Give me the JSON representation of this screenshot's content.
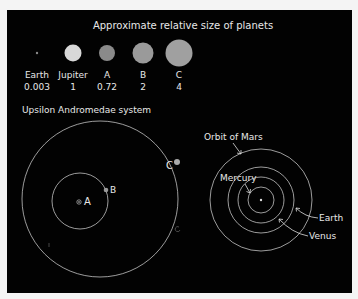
{
  "size_chart": {
    "title": "Approximate relative size of planets",
    "planets": [
      {
        "name": "Earth",
        "value": "0.003",
        "color": "#888888"
      },
      {
        "name": "Jupiter",
        "value": "1",
        "color": "#d8d8d8"
      },
      {
        "name": "A",
        "value": "0.72",
        "color": "#8a8a8a"
      },
      {
        "name": "B",
        "value": "2",
        "color": "#9a9a9a"
      },
      {
        "name": "C",
        "value": "4",
        "color": "#a0a0a0"
      }
    ]
  },
  "upsilon": {
    "title": "Upsilon Andromedae system",
    "labels": {
      "a": "A",
      "b": "B",
      "c": "C"
    }
  },
  "solar": {
    "labels": {
      "mars": "Orbit of Mars",
      "mercury": "Mercury",
      "earth": "Earth",
      "venus": "Venus"
    }
  },
  "colors": {
    "background": "#020202",
    "orbit": "#e0e0e0",
    "text": "#e8e8e8"
  }
}
